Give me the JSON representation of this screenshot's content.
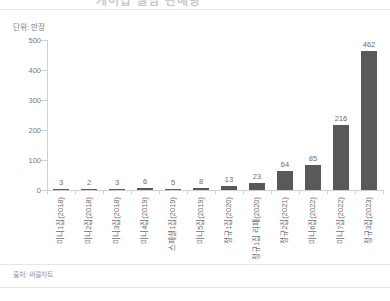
{
  "header": {
    "cut_off_text": "케이팝 앨범 판매량"
  },
  "unit_caption": "단위: 만장",
  "footer": {
    "source": "출처: 써클차트"
  },
  "chart_data": {
    "type": "bar",
    "title": "",
    "subtitle": "",
    "xlabel": "",
    "ylabel": "",
    "unit": "단위: 만장",
    "ylim": [
      0,
      500
    ],
    "yticks": [
      0,
      100,
      200,
      300,
      400,
      500
    ],
    "ytick_labels": [
      "0",
      "100",
      "200",
      "300",
      "400",
      "500"
    ],
    "grid": false,
    "legend": "none",
    "bar_color": "#595959",
    "axis_color": "#d0d0d0",
    "label_color": "#6e6e6e",
    "categories": [
      "미니1집(2018)",
      "미니2집(2018)",
      "미니3집(2018)",
      "미니4집(2019)",
      "스페셜1집(2019)",
      "미니5집(2019)",
      "정규1집(2020)",
      "정규1집 리패(2020)",
      "정규2집(2021)",
      "미니6집(2022)",
      "미니7집(2022)",
      "정규3집(2023)"
    ],
    "values": [
      3,
      2,
      3,
      6,
      5,
      8,
      13,
      23,
      64,
      85,
      216,
      462
    ],
    "value_labels": [
      "3",
      "2",
      "3",
      "6",
      "5",
      "8",
      "13",
      "23",
      "64",
      "85",
      "216",
      "462"
    ]
  }
}
